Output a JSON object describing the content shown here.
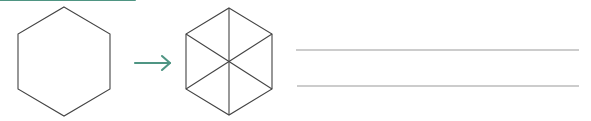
{
  "canvas": {
    "width": 591,
    "height": 121,
    "background": "#ffffff"
  },
  "colors": {
    "shape_stroke": "#444444",
    "arrow": "#4f9583",
    "rule": "#9a9a9a"
  },
  "shapes": {
    "source_hexagon": {
      "name": "hexagon",
      "orientation": "pointy-top",
      "center": {
        "x": 64,
        "y": 61.5
      },
      "radius": 54.5,
      "half_width": 46,
      "stroke": "#444444",
      "stroke_width": 1.1,
      "fill": "none",
      "vertices": [
        {
          "x": 64,
          "y": 7
        },
        {
          "x": 110,
          "y": 34
        },
        {
          "x": 110,
          "y": 89
        },
        {
          "x": 64,
          "y": 116
        },
        {
          "x": 18,
          "y": 89
        },
        {
          "x": 18,
          "y": 34
        }
      ]
    },
    "result_hexagon": {
      "name": "hexagon-partitioned",
      "orientation": "pointy-top",
      "center": {
        "x": 229,
        "y": 61.5
      },
      "radius": 53.5,
      "half_width": 43,
      "stroke": "#444444",
      "stroke_width": 1.1,
      "fill": "none",
      "triangle_count": 6,
      "vertices": [
        {
          "x": 229,
          "y": 8
        },
        {
          "x": 272,
          "y": 34
        },
        {
          "x": 272,
          "y": 89
        },
        {
          "x": 229,
          "y": 115
        },
        {
          "x": 186,
          "y": 89
        },
        {
          "x": 186,
          "y": 34
        }
      ],
      "diagonals": [
        {
          "label": "vertical-diagonal",
          "x1": 229,
          "y1": 8,
          "x2": 229,
          "y2": 115
        },
        {
          "label": "upper-left-to-lower-right-diagonal",
          "x1": 186,
          "y1": 34,
          "x2": 272,
          "y2": 89
        },
        {
          "label": "lower-left-to-upper-right-diagonal",
          "x1": 186,
          "y1": 89,
          "x2": 272,
          "y2": 34
        }
      ]
    }
  },
  "arrow": {
    "name": "rightwards-arrow",
    "direction": "right",
    "color": "#4f9583",
    "shaft": {
      "x1": 135,
      "y1": 63,
      "x2": 170,
      "y2": 63
    },
    "head": {
      "upper": "163,56 170,63",
      "lower": "170,63 163,70"
    }
  },
  "rules": {
    "name": "writing-lines",
    "color": "#9a9a9a",
    "count": 2,
    "lines": [
      {
        "label": "rule-line-1",
        "x1": 296,
        "y1": 50,
        "x2": 579,
        "y2": 50
      },
      {
        "label": "rule-line-2",
        "x1": 297,
        "y1": 86,
        "x2": 579,
        "y2": 86
      }
    ]
  }
}
